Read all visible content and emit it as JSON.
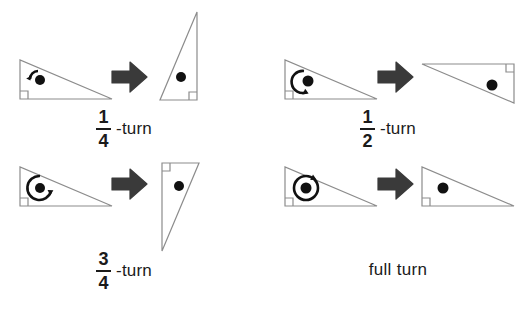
{
  "figure": {
    "background_color": "#ffffff",
    "outline_color": "#8c8c8c",
    "mark_color": "#111111",
    "arrow_color": "#3a3a3a",
    "text_color": "#1b1b1b"
  },
  "panels": [
    {
      "id": "quarter-turn",
      "label": {
        "type": "fraction",
        "numerator": "1",
        "denominator": "4",
        "suffix": "-turn"
      },
      "rotation_degrees": 90,
      "rotation_direction": "counterclockwise",
      "turn_icon": "quarter-arc-arrow",
      "source_shape": "right-triangle-wide",
      "result_shape": "right-triangle-tall-angle-bottom-right",
      "transition_icon": "block-arrow-right"
    },
    {
      "id": "half-turn",
      "label": {
        "type": "fraction",
        "numerator": "1",
        "denominator": "2",
        "suffix": "-turn"
      },
      "rotation_degrees": 180,
      "rotation_direction": "counterclockwise",
      "turn_icon": "half-arc-arrow",
      "source_shape": "right-triangle-wide",
      "result_shape": "right-triangle-wide-angle-top-right",
      "transition_icon": "block-arrow-right"
    },
    {
      "id": "three-quarter-turn",
      "label": {
        "type": "fraction",
        "numerator": "3",
        "denominator": "4",
        "suffix": "-turn"
      },
      "rotation_degrees": 270,
      "rotation_direction": "counterclockwise",
      "turn_icon": "three-quarter-arc-arrow",
      "source_shape": "right-triangle-wide",
      "result_shape": "right-triangle-tall-angle-top-left",
      "transition_icon": "block-arrow-right"
    },
    {
      "id": "full-turn",
      "label": {
        "type": "text",
        "text": "full turn"
      },
      "rotation_degrees": 360,
      "rotation_direction": "counterclockwise",
      "turn_icon": "full-circle-arc-arrow",
      "source_shape": "right-triangle-wide",
      "result_shape": "right-triangle-wide",
      "transition_icon": "block-arrow-right"
    }
  ]
}
